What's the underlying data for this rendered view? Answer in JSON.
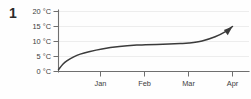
{
  "figure": {
    "number": "1"
  },
  "chart_data": {
    "type": "line",
    "title": "",
    "subtitle": "",
    "xlabel": "",
    "ylabel": "",
    "grid": true,
    "legend": false,
    "legend_position": "none",
    "annotations": [
      "arrowhead at end of curve pointing up-right"
    ],
    "series": [
      {
        "name": "Temperature",
        "unit": "°C",
        "color": "#3b3b3b",
        "x": [
          0.0,
          0.1,
          0.2,
          0.35,
          0.5,
          0.7,
          1.0,
          1.4,
          1.8,
          2.0,
          2.4,
          2.8,
          3.0,
          3.3,
          3.6,
          3.85,
          4.0
        ],
        "values": [
          0.6,
          2.4,
          3.6,
          4.9,
          5.8,
          6.6,
          7.5,
          8.3,
          8.8,
          8.9,
          9.1,
          9.3,
          9.5,
          10.2,
          11.6,
          13.4,
          15.0
        ]
      }
    ],
    "x_ticks": [
      {
        "value": 1,
        "label": "Jan"
      },
      {
        "value": 2,
        "label": "Feb"
      },
      {
        "value": 3,
        "label": "Mar"
      },
      {
        "value": 4,
        "label": "Apr"
      }
    ],
    "y_ticks": [
      {
        "value": 20,
        "label": "20 °C"
      },
      {
        "value": 15,
        "label": "15 °C"
      },
      {
        "value": 10,
        "label": "10 °C"
      },
      {
        "value": 5,
        "label": "5 °C"
      },
      {
        "value": 0,
        "label": "0 °C"
      }
    ],
    "xlim": [
      0,
      4
    ],
    "ylim": [
      0,
      20
    ],
    "colors": {
      "curve": "#3b3b3b",
      "axis": "#6f6f6f",
      "grid": "#ededed",
      "text": "#3d3d3d",
      "background": "#fefefe"
    }
  }
}
